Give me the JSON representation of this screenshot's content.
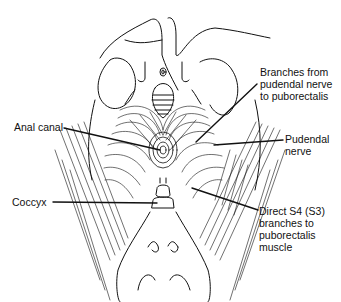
{
  "figure": {
    "line_color": "#111111",
    "background": "#ffffff"
  },
  "labels": {
    "branches_pudendal": "Branches from\npudendal nerve\nto puborectalis",
    "anal_canal": "Anal canal",
    "pudendal_nerve": "Pudendal\nnerve",
    "coccyx": "Coccyx",
    "direct_s4": "Direct S4 (S3)\nbranches to\npuborectalis\nmuscle"
  }
}
